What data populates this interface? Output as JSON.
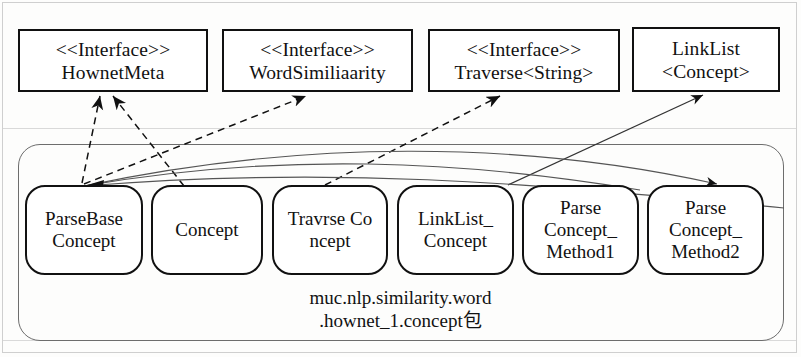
{
  "diagram": {
    "kind": "uml-class-diagram",
    "interfaces": [
      {
        "stereotype": "<<Interface>>",
        "name": "HownetMeta",
        "x": 18,
        "y": 29,
        "w": 190,
        "h": 63
      },
      {
        "stereotype": "<<Interface>>",
        "name": "WordSimiliaarity",
        "x": 222,
        "y": 29,
        "w": 191,
        "h": 63
      },
      {
        "stereotype": "<<Interface>>",
        "name": "Traverse<String>",
        "x": 428,
        "y": 29,
        "w": 192,
        "h": 63
      },
      {
        "stereotype": "LinkList",
        "name": "<Concept>",
        "x": 632,
        "y": 27,
        "w": 148,
        "h": 65
      }
    ],
    "package": {
      "label_line1": "muc.nlp.similarity.word",
      "label_line2": ".hownet_1.concept包",
      "x": 18,
      "y": 144,
      "w": 766,
      "h": 197
    },
    "classes": [
      {
        "lines": [
          "ParseBase",
          "Concept"
        ],
        "x": 25,
        "y": 185,
        "w": 118,
        "h": 90
      },
      {
        "lines": [
          "Concept"
        ],
        "x": 151,
        "y": 185,
        "w": 112,
        "h": 90
      },
      {
        "lines": [
          "Travrse Co",
          "ncept"
        ],
        "x": 272,
        "y": 185,
        "w": 116,
        "h": 90
      },
      {
        "lines": [
          "LinkList_",
          "Concept"
        ],
        "x": 397,
        "y": 185,
        "w": 117,
        "h": 90
      },
      {
        "lines": [
          "Parse",
          "Concept_",
          "Method1"
        ],
        "x": 522,
        "y": 185,
        "w": 117,
        "h": 90
      },
      {
        "lines": [
          "Parse",
          "Concept_",
          "Method2"
        ],
        "x": 647,
        "y": 185,
        "w": 117,
        "h": 90
      }
    ],
    "relations": [
      {
        "name": "concept-realizes-hownetmeta",
        "style": "dashed",
        "arrow": "filled",
        "from": "Concept",
        "to": "HownetMeta"
      },
      {
        "name": "travrseconcept-realizes-hownetmeta",
        "style": "dashed",
        "arrow": "filled",
        "from": "TravrseConcept",
        "to": "HownetMeta"
      },
      {
        "name": "parsebase-realizes-wordsimiliaarity",
        "style": "dashed",
        "arrow": "filled",
        "from": "ParseBaseConcept",
        "to": "WordSimiliaarity"
      },
      {
        "name": "linklistconcept-realizes-traverse",
        "style": "dashed",
        "arrow": "filled",
        "from": "LinkList_Concept",
        "to": "Traverse<String>"
      },
      {
        "name": "parsebase-assoc-linklist-generic",
        "style": "solid",
        "arrow": "filled",
        "from": "ParseBaseConcept",
        "to": "LinkList<Concept>"
      },
      {
        "name": "concept-depends-parsebase",
        "style": "solid",
        "arrow": "filled",
        "from": "LinkList_Concept",
        "to": "ParseBaseConcept"
      },
      {
        "name": "method1-depends-parsebase",
        "style": "solid",
        "arrow": "filled",
        "from": "ParseConcept_Method1",
        "to": "ParseBaseConcept"
      },
      {
        "name": "method2-depends-parsebase",
        "style": "solid",
        "arrow": "filled",
        "from": "ParseConcept_Method2",
        "to": "ParseBaseConcept"
      }
    ],
    "colors": {
      "stroke": "#111111",
      "package_stroke": "#6d6d6d",
      "background": "#fdfdfc"
    }
  }
}
